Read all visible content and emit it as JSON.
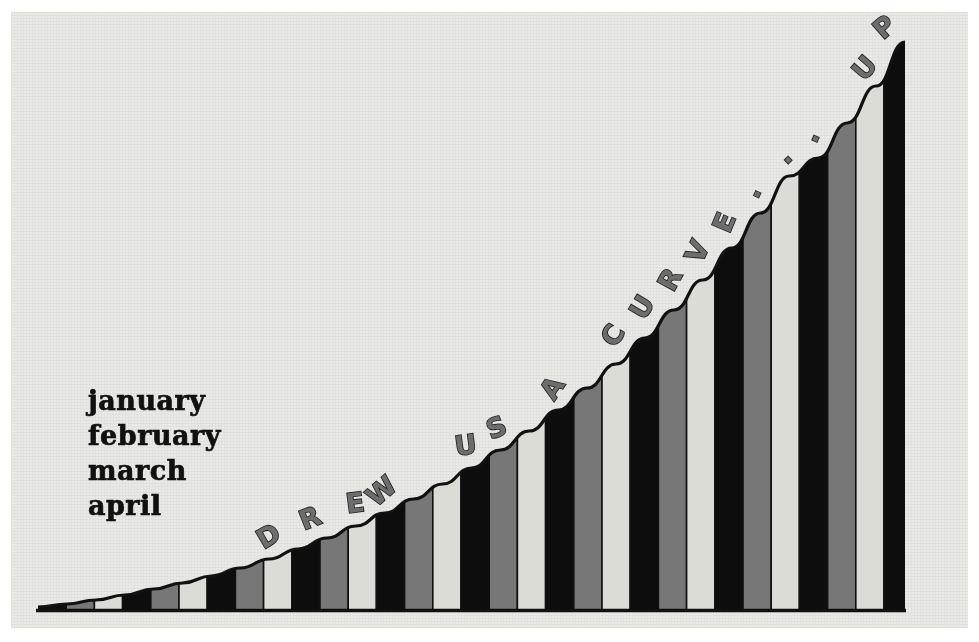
{
  "poster": {
    "title": "DREW US A CURVE... UP",
    "background_color": "#e9e9e5",
    "border_color": "#ffffff"
  },
  "months": {
    "label": "month list",
    "items": [
      "january",
      "february",
      "march",
      "april"
    ],
    "color": "#111111"
  },
  "caption": {
    "text": "DREW US A CURVE... UP",
    "letters": [
      "D",
      "R",
      "E",
      "W",
      " ",
      "U",
      "S",
      " ",
      "A",
      " ",
      "C",
      "U",
      "R",
      "V",
      "E",
      ".",
      ".",
      ".",
      " ",
      "U",
      "P"
    ],
    "fill_color": "#6d6d6d",
    "outline_color": "#1c1c1c"
  },
  "chart_data": {
    "type": "bar",
    "xlabel": "",
    "ylabel": "",
    "grid": false,
    "legend": "none",
    "axis_line_color": "#111111",
    "curve_color": "#111111",
    "bar_colors": [
      "#0d0d0d",
      "#777777",
      "#dcdcd7"
    ],
    "bar_outline_color": "#111111",
    "baseline_y": 610,
    "plot_left": 38,
    "plot_right": 905,
    "plot_top": 42,
    "bar_pitch": 28.2,
    "ylim": [
      0,
      568
    ],
    "categories": [
      "1",
      "2",
      "3",
      "4",
      "5",
      "6",
      "7",
      "8",
      "9",
      "10",
      "11",
      "12",
      "13",
      "14",
      "15",
      "16",
      "17",
      "18",
      "19",
      "20",
      "21",
      "22",
      "23",
      "24",
      "25",
      "26",
      "27",
      "28",
      "29",
      "30",
      "31"
    ],
    "values": [
      3,
      6,
      10,
      15,
      21,
      27,
      34,
      42,
      51,
      61,
      72,
      84,
      97,
      111,
      126,
      142,
      160,
      179,
      200,
      222,
      246,
      272,
      300,
      330,
      362,
      397,
      434,
      452,
      487,
      524,
      568
    ]
  }
}
